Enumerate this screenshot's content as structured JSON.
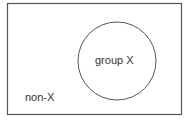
{
  "diagram": {
    "type": "venn",
    "universe": {
      "label": "non-X"
    },
    "sets": [
      {
        "label": "group X"
      }
    ],
    "colors": {
      "stroke": "#555555",
      "background": "#ffffff",
      "text": "#333333"
    }
  }
}
